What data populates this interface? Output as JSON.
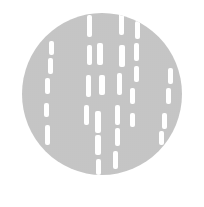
{
  "image": {
    "subject": "grey halftone-textured circular disc with white vertical dash marks",
    "colors": {
      "background": "#ffffff",
      "disc": "#cfcfcf",
      "texture": "#b9b9b9",
      "marks": "#ffffff"
    },
    "disc": {
      "x": 22,
      "y": 13,
      "w": 160,
      "h": 162
    },
    "dashes": [
      {
        "x": 65,
        "y": 2,
        "w": 5,
        "h": 22
      },
      {
        "x": 97,
        "y": 0,
        "w": 5,
        "h": 22
      },
      {
        "x": 113,
        "y": 8,
        "w": 5,
        "h": 18
      },
      {
        "x": 27,
        "y": 28,
        "w": 5,
        "h": 14
      },
      {
        "x": 65,
        "y": 32,
        "w": 5,
        "h": 20
      },
      {
        "x": 75,
        "y": 30,
        "w": 6,
        "h": 22
      },
      {
        "x": 97,
        "y": 32,
        "w": 6,
        "h": 22
      },
      {
        "x": 112,
        "y": 30,
        "w": 5,
        "h": 18
      },
      {
        "x": 26,
        "y": 45,
        "w": 5,
        "h": 16
      },
      {
        "x": 112,
        "y": 53,
        "w": 5,
        "h": 16
      },
      {
        "x": 146,
        "y": 55,
        "w": 5,
        "h": 16
      },
      {
        "x": 23,
        "y": 65,
        "w": 5,
        "h": 16
      },
      {
        "x": 64,
        "y": 62,
        "w": 5,
        "h": 22
      },
      {
        "x": 77,
        "y": 62,
        "w": 6,
        "h": 20
      },
      {
        "x": 95,
        "y": 60,
        "w": 5,
        "h": 22
      },
      {
        "x": 108,
        "y": 75,
        "w": 5,
        "h": 16
      },
      {
        "x": 144,
        "y": 75,
        "w": 5,
        "h": 16
      },
      {
        "x": 22,
        "y": 90,
        "w": 5,
        "h": 14
      },
      {
        "x": 62,
        "y": 92,
        "w": 5,
        "h": 20
      },
      {
        "x": 73,
        "y": 98,
        "w": 6,
        "h": 22
      },
      {
        "x": 93,
        "y": 92,
        "w": 5,
        "h": 20
      },
      {
        "x": 108,
        "y": 100,
        "w": 5,
        "h": 14
      },
      {
        "x": 140,
        "y": 100,
        "w": 5,
        "h": 16
      },
      {
        "x": 23,
        "y": 112,
        "w": 5,
        "h": 20
      },
      {
        "x": 73,
        "y": 122,
        "w": 6,
        "h": 20
      },
      {
        "x": 93,
        "y": 115,
        "w": 5,
        "h": 18
      },
      {
        "x": 137,
        "y": 118,
        "w": 5,
        "h": 14
      },
      {
        "x": 74,
        "y": 146,
        "w": 5,
        "h": 16
      },
      {
        "x": 91,
        "y": 138,
        "w": 5,
        "h": 18
      }
    ]
  }
}
